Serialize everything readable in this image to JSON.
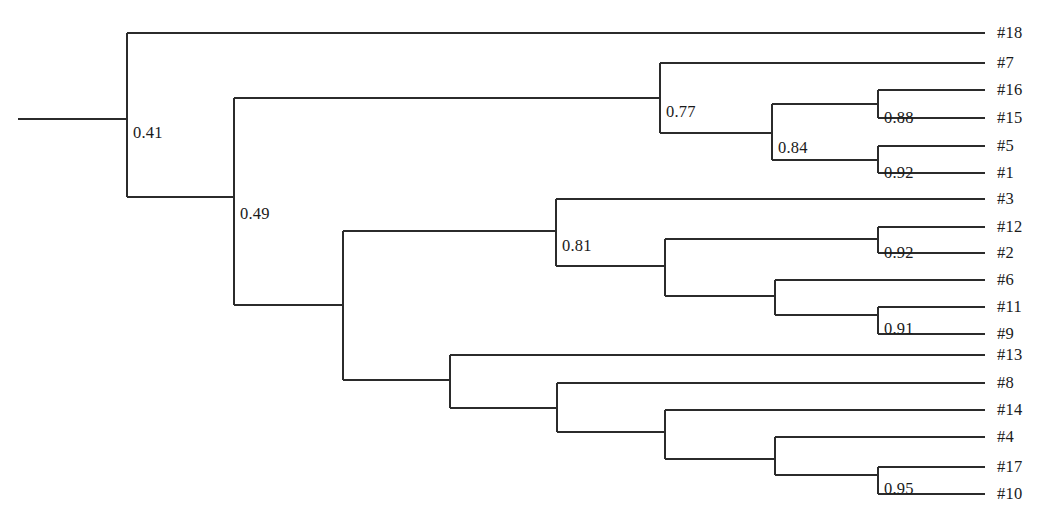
{
  "figure": {
    "kind": "phylogenetic-tree",
    "background_color": "#ffffff",
    "line_color": "#2b2b2b",
    "text_color": "#1a1a1a"
  },
  "chart_data": {
    "type": "tree",
    "title": "",
    "xlabel": "",
    "ylabel": "",
    "orientation": "left-to-right-rectangular-cladogram",
    "tip_count": 18,
    "support_label_count": 11,
    "tips": [
      {
        "label": "#18",
        "y": 33,
        "branch_x_start": 127,
        "branch_x_end": 985,
        "label_x": 997,
        "label_y": 33
      },
      {
        "label": "#7",
        "y": 63,
        "branch_x_start": 660,
        "branch_x_end": 985,
        "label_x": 997,
        "label_y": 63
      },
      {
        "label": "#16",
        "y": 90,
        "branch_x_start": 878,
        "branch_x_end": 985,
        "label_x": 997,
        "label_y": 90
      },
      {
        "label": "#15",
        "y": 118,
        "branch_x_start": 878,
        "branch_x_end": 985,
        "label_x": 997,
        "label_y": 118
      },
      {
        "label": "#5",
        "y": 146,
        "branch_x_start": 878,
        "branch_x_end": 985,
        "label_x": 997,
        "label_y": 146
      },
      {
        "label": "#1",
        "y": 173,
        "branch_x_start": 878,
        "branch_x_end": 985,
        "label_x": 997,
        "label_y": 173
      },
      {
        "label": "#3",
        "y": 199,
        "branch_x_start": 556,
        "branch_x_end": 985,
        "label_x": 997,
        "label_y": 199
      },
      {
        "label": "#12",
        "y": 227,
        "branch_x_start": 878,
        "branch_x_end": 985,
        "label_x": 997,
        "label_y": 227
      },
      {
        "label": "#2",
        "y": 253,
        "branch_x_start": 878,
        "branch_x_end": 985,
        "label_x": 997,
        "label_y": 253
      },
      {
        "label": "#6",
        "y": 280,
        "branch_x_start": 775,
        "branch_x_end": 985,
        "label_x": 997,
        "label_y": 280
      },
      {
        "label": "#11",
        "y": 307,
        "branch_x_start": 878,
        "branch_x_end": 985,
        "label_x": 997,
        "label_y": 307
      },
      {
        "label": "#9",
        "y": 334,
        "branch_x_start": 878,
        "branch_x_end": 985,
        "label_x": 997,
        "label_y": 334
      },
      {
        "label": "#13",
        "y": 355,
        "branch_x_start": 450,
        "branch_x_end": 985,
        "label_x": 997,
        "label_y": 355
      },
      {
        "label": "#8",
        "y": 383,
        "branch_x_start": 557,
        "branch_x_end": 985,
        "label_x": 997,
        "label_y": 383
      },
      {
        "label": "#14",
        "y": 410,
        "branch_x_start": 665,
        "branch_x_end": 985,
        "label_x": 997,
        "label_y": 410
      },
      {
        "label": "#4",
        "y": 437,
        "branch_x_start": 775,
        "branch_x_end": 985,
        "label_x": 997,
        "label_y": 437
      },
      {
        "label": "#17",
        "y": 467,
        "branch_x_start": 878,
        "branch_x_end": 985,
        "label_x": 997,
        "label_y": 467
      },
      {
        "label": "#10",
        "y": 494,
        "branch_x_start": 878,
        "branch_x_end": 985,
        "label_x": 997,
        "label_y": 494
      }
    ],
    "root_branch": {
      "x_start": 18,
      "x_end": 127,
      "y": 119
    },
    "nodes": [
      {
        "id": "n-root",
        "support": "0.41",
        "x": 127,
        "y_top": 33,
        "y_bottom": 197,
        "parent_y": 119,
        "label_x": 133,
        "label_y": 125
      },
      {
        "id": "n-049",
        "support": "0.49",
        "x": 234,
        "y_top": 98,
        "y_bottom": 305,
        "parent_y": 197,
        "label_x": 240,
        "label_y": 206
      },
      {
        "id": "n-077",
        "support": "0.77",
        "x": 660,
        "y_top": 63,
        "y_bottom": 133,
        "parent_y": 98,
        "label_x": 666,
        "label_y": 104
      },
      {
        "id": "n-084",
        "support": "0.84",
        "x": 772,
        "y_top": 104,
        "y_bottom": 160,
        "parent_y": 133,
        "label_x": 778,
        "label_y": 140
      },
      {
        "id": "n-088",
        "support": "0.88",
        "x": 878,
        "y_top": 90,
        "y_bottom": 118,
        "parent_y": 104,
        "label_x": 884,
        "label_y": 110
      },
      {
        "id": "n-092a",
        "support": "0.92",
        "x": 878,
        "y_top": 146,
        "y_bottom": 173,
        "parent_y": 160,
        "label_x": 884,
        "label_y": 165
      },
      {
        "id": "n-mid",
        "support": "",
        "x": 343,
        "y_top": 231,
        "y_bottom": 380,
        "parent_y": 305,
        "label_x": 349,
        "label_y": 311
      },
      {
        "id": "n-081",
        "support": "0.81",
        "x": 556,
        "y_top": 199,
        "y_bottom": 266,
        "parent_y": 231,
        "label_x": 562,
        "label_y": 238
      },
      {
        "id": "n-i665",
        "support": "",
        "x": 665,
        "y_top": 239,
        "y_bottom": 296,
        "parent_y": 266,
        "label_x": 671,
        "label_y": 272
      },
      {
        "id": "n-092b",
        "support": "0.92",
        "x": 878,
        "y_top": 227,
        "y_bottom": 253,
        "parent_y": 239,
        "label_x": 884,
        "label_y": 245
      },
      {
        "id": "n-i775",
        "support": "",
        "x": 775,
        "y_top": 280,
        "y_bottom": 315,
        "parent_y": 296,
        "label_x": 781,
        "label_y": 302
      },
      {
        "id": "n-091",
        "support": "0.91",
        "x": 878,
        "y_top": 307,
        "y_bottom": 334,
        "parent_y": 315,
        "label_x": 884,
        "label_y": 321
      },
      {
        "id": "n-b450",
        "support": "",
        "x": 450,
        "y_top": 355,
        "y_bottom": 408,
        "parent_y": 380,
        "label_x": 456,
        "label_y": 386
      },
      {
        "id": "n-b557",
        "support": "",
        "x": 557,
        "y_top": 383,
        "y_bottom": 432,
        "parent_y": 408,
        "label_x": 563,
        "label_y": 414
      },
      {
        "id": "n-b665",
        "support": "",
        "x": 665,
        "y_top": 410,
        "y_bottom": 459,
        "parent_y": 432,
        "label_x": 671,
        "label_y": 438
      },
      {
        "id": "n-b775",
        "support": "",
        "x": 775,
        "y_top": 437,
        "y_bottom": 475,
        "parent_y": 459,
        "label_x": 781,
        "label_y": 465
      },
      {
        "id": "n-095",
        "support": "0.95",
        "x": 878,
        "y_top": 467,
        "y_bottom": 494,
        "parent_y": 475,
        "label_x": 884,
        "label_y": 481
      }
    ],
    "internal_connectors": [
      {
        "from_x": 127,
        "to_x": 234,
        "y": 197
      },
      {
        "from_x": 234,
        "to_x": 660,
        "y": 98
      },
      {
        "from_x": 234,
        "to_x": 343,
        "y": 305
      },
      {
        "from_x": 660,
        "to_x": 772,
        "y": 133
      },
      {
        "from_x": 772,
        "to_x": 878,
        "y": 104
      },
      {
        "from_x": 772,
        "to_x": 878,
        "y": 160
      },
      {
        "from_x": 343,
        "to_x": 556,
        "y": 231
      },
      {
        "from_x": 343,
        "to_x": 450,
        "y": 380
      },
      {
        "from_x": 556,
        "to_x": 665,
        "y": 266
      },
      {
        "from_x": 665,
        "to_x": 878,
        "y": 239
      },
      {
        "from_x": 665,
        "to_x": 775,
        "y": 296
      },
      {
        "from_x": 775,
        "to_x": 878,
        "y": 315
      },
      {
        "from_x": 450,
        "to_x": 557,
        "y": 408
      },
      {
        "from_x": 557,
        "to_x": 665,
        "y": 432
      },
      {
        "from_x": 665,
        "to_x": 775,
        "y": 459
      },
      {
        "from_x": 775,
        "to_x": 878,
        "y": 475
      }
    ],
    "support_values": [
      "0.41",
      "0.49",
      "0.77",
      "0.84",
      "0.88",
      "0.92",
      "0.81",
      "0.92",
      "0.91",
      "0.95"
    ],
    "tip_labels": [
      "#18",
      "#7",
      "#16",
      "#15",
      "#5",
      "#1",
      "#3",
      "#12",
      "#2",
      "#6",
      "#11",
      "#9",
      "#13",
      "#8",
      "#14",
      "#4",
      "#17",
      "#10"
    ]
  }
}
